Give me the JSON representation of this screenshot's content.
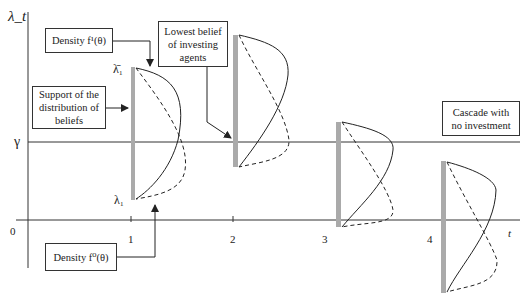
{
  "axes": {
    "y_label": "λ_t",
    "x_label": "t",
    "origin": "0",
    "gamma": "γ",
    "x_ticks": [
      "1",
      "2",
      "3",
      "4"
    ]
  },
  "annotations": {
    "lambda_bar": "λ̄₁",
    "lambda_under": "λ₁"
  },
  "boxes": {
    "density_f1": "Density f¹(θ)",
    "lowest_belief": "Lowest belief of investing agents",
    "support": "Support of the distribution of beliefs",
    "cascade": "Cascade with no investment",
    "density_f0": "Density f⁰(θ)"
  }
}
